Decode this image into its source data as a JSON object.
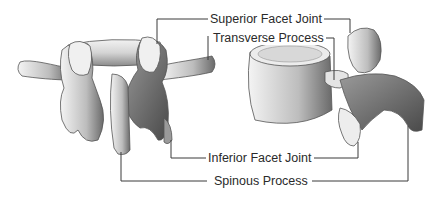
{
  "diagram": {
    "labels": {
      "superior_facet_joint": "Superior Facet Joint",
      "transverse_process": "Transverse Process",
      "inferior_facet_joint": "Inferior Facet Joint",
      "spinous_process": "Spinous Process"
    },
    "colors": {
      "leader_line": "#3a3a3a",
      "bone_light": "#efefef",
      "bone_mid": "#b8b8b8",
      "bone_dark": "#5a5a5a",
      "text": "#2a2a2a"
    }
  }
}
